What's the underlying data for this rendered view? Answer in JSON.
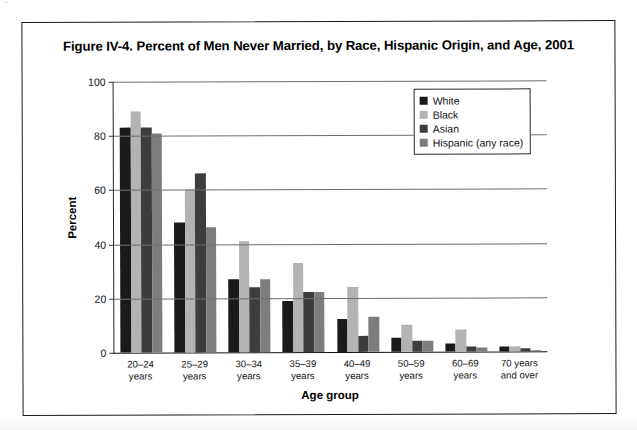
{
  "page": {
    "top_fragment_text": "..."
  },
  "figure": {
    "title": "Figure IV-4. Percent of Men Never Married, by Race, Hispanic Origin, and Age, 2001"
  },
  "axes": {
    "y_title": "Percent",
    "x_title": "Age group",
    "y_ticks": [
      "100",
      "80",
      "60",
      "40",
      "20",
      "0"
    ]
  },
  "legend": {
    "items": [
      {
        "label": "White",
        "color": "#1a1a1a"
      },
      {
        "label": "Black",
        "color": "#b3b3b3"
      },
      {
        "label": "Asian",
        "color": "#3d3d3d"
      },
      {
        "label": "Hispanic (any race)",
        "color": "#7d7d7d"
      }
    ]
  },
  "x_labels": [
    {
      "line1": "20–24",
      "line2": "years"
    },
    {
      "line1": "25–29",
      "line2": "years"
    },
    {
      "line1": "30–34",
      "line2": "years"
    },
    {
      "line1": "35–39",
      "line2": "years"
    },
    {
      "line1": "40–49",
      "line2": "years"
    },
    {
      "line1": "50–59",
      "line2": "years"
    },
    {
      "line1": "60–69",
      "line2": "years"
    },
    {
      "line1": "70 years",
      "line2": "and over"
    }
  ],
  "chart_data": {
    "type": "bar",
    "title": "Figure IV-4. Percent of Men Never Married, by Race, Hispanic Origin, and Age, 2001",
    "xlabel": "Age group",
    "ylabel": "Percent",
    "ylim": [
      0,
      100
    ],
    "yticks": [
      0,
      20,
      40,
      60,
      80,
      100
    ],
    "grid": true,
    "legend_position": "upper-right-inside",
    "categories": [
      "20–24 years",
      "25–29 years",
      "30–34 years",
      "35–39 years",
      "40–49 years",
      "50–59 years",
      "60–69 years",
      "70 years and over"
    ],
    "series": [
      {
        "name": "White",
        "color": "#1a1a1a",
        "values": [
          83,
          48,
          27,
          19,
          12,
          5,
          3,
          2
        ]
      },
      {
        "name": "Black",
        "color": "#b3b3b3",
        "values": [
          89,
          60,
          41,
          33,
          24,
          10,
          8,
          2
        ]
      },
      {
        "name": "Asian",
        "color": "#3d3d3d",
        "values": [
          83,
          66,
          24,
          22,
          6,
          4,
          2,
          1
        ]
      },
      {
        "name": "Hispanic (any race)",
        "color": "#7d7d7d",
        "values": [
          81,
          46,
          27,
          22,
          13,
          4,
          1.5,
          0.5
        ]
      }
    ]
  }
}
